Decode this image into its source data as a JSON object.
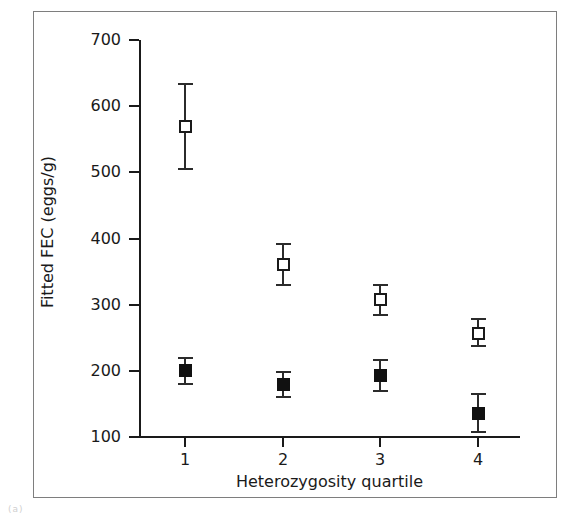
{
  "figure": {
    "caption_fragment": "(a)"
  },
  "chart_data": {
    "type": "scatter",
    "title": "",
    "xlabel": "Heterozygosity quartile",
    "ylabel": "Fitted FEC (eggs/g)",
    "categories": [
      "1",
      "2",
      "3",
      "4"
    ],
    "x": [
      1,
      2,
      3,
      4
    ],
    "ylim": [
      100,
      700
    ],
    "yticks": [
      100,
      200,
      300,
      400,
      500,
      600,
      700
    ],
    "ytick_labels": [
      "100",
      "200",
      "300",
      "400",
      "500",
      "600",
      "700"
    ],
    "xticks": [
      1,
      2,
      3,
      4
    ],
    "xtick_labels": [
      "1",
      "2",
      "3",
      "4"
    ],
    "grid": false,
    "legend": "none",
    "error_bars": "vertical, capped",
    "series": [
      {
        "name": "open-square-series",
        "marker": "open-square",
        "color": "#ffffff",
        "edge_color": "#1a1a1a",
        "values": [
          570,
          360,
          308,
          257
        ],
        "err_low": [
          505,
          330,
          285,
          238
        ],
        "err_high": [
          633,
          392,
          330,
          278
        ]
      },
      {
        "name": "filled-square-series",
        "marker": "filled-square",
        "color": "#111111",
        "edge_color": "#111111",
        "values": [
          200,
          179,
          193,
          136
        ],
        "err_low": [
          180,
          160,
          170,
          108
        ],
        "err_high": [
          220,
          198,
          217,
          165
        ]
      }
    ]
  }
}
